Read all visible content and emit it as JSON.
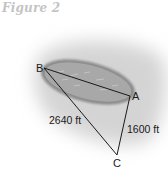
{
  "figure": {
    "title": "Figure 2",
    "points": {
      "A": "A",
      "B": "B",
      "C": "C"
    },
    "segments": {
      "BC": "2640 ft",
      "AC": "1600 ft"
    },
    "colors": {
      "title": "#c4c4c4",
      "shadow": "#d9d9d9",
      "lake_fill": "#a9a9a9",
      "lake_rim": "#7a7a7a",
      "lines": "#1a1a1a"
    }
  }
}
